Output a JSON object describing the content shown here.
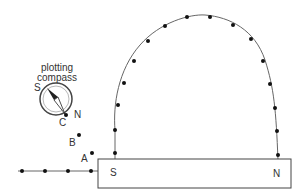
{
  "diagram": {
    "magnet": {
      "south_label": "S",
      "north_label": "N"
    },
    "compass": {
      "label_line1": "plotting",
      "label_line2": "compass",
      "south_label": "S",
      "north_label": "N"
    },
    "points": {
      "a": "A",
      "b": "B",
      "c": "C"
    },
    "colors": {
      "line": "#555555",
      "dot": "#111111"
    }
  }
}
